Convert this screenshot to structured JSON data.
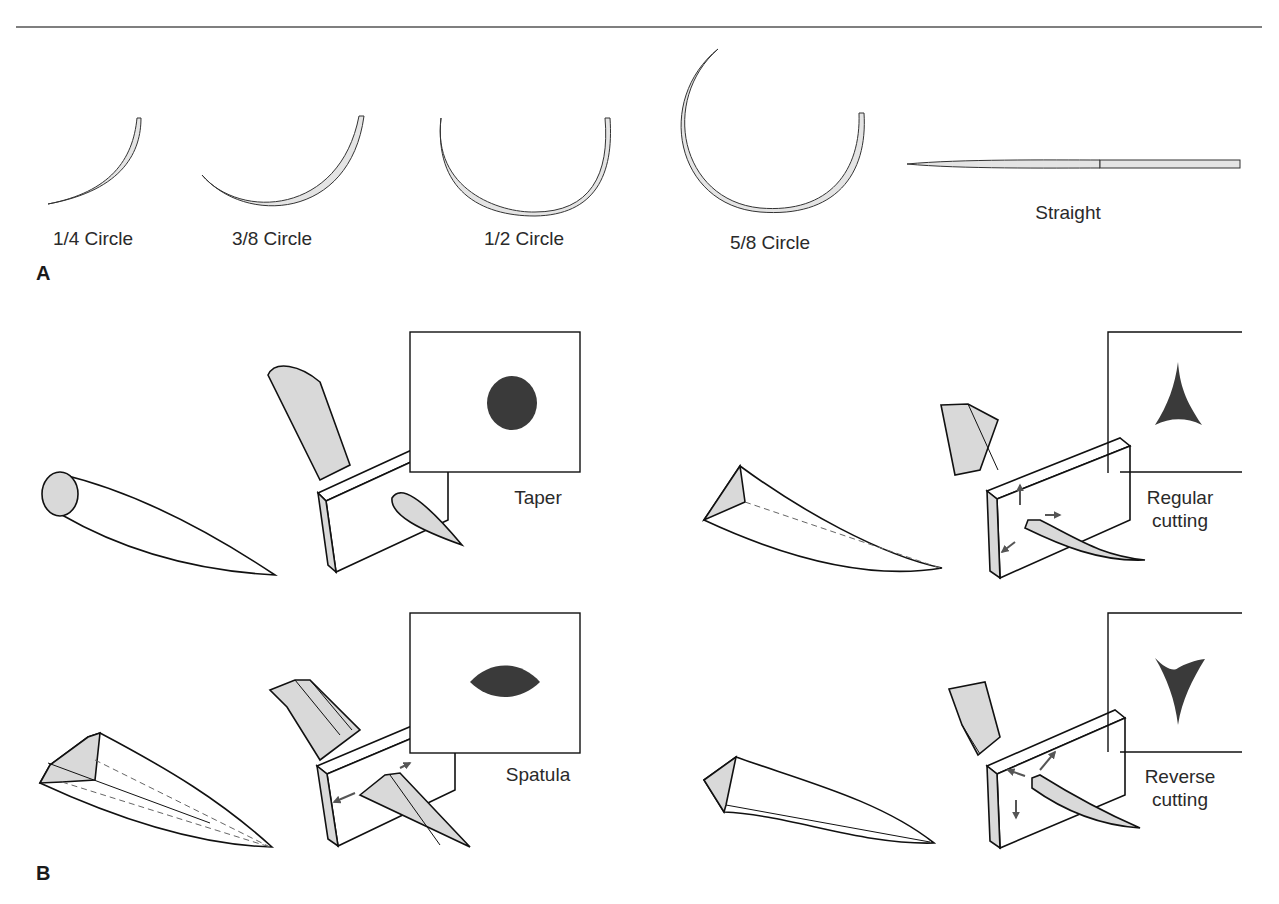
{
  "figure": {
    "panel_a": {
      "label": "A",
      "needles": [
        {
          "shape": "1/4 Circle"
        },
        {
          "shape": "3/8 Circle"
        },
        {
          "shape": "1/2 Circle"
        },
        {
          "shape": "5/8 Circle"
        },
        {
          "shape": "Straight"
        }
      ]
    },
    "panel_b": {
      "label": "B",
      "tips": [
        {
          "name": "Taper",
          "line1": "Taper",
          "line2": "",
          "cross_section": "circle"
        },
        {
          "name": "Regular cutting",
          "line1": "Regular",
          "line2": "cutting",
          "cross_section": "triangle-apex-up"
        },
        {
          "name": "Spatula",
          "line1": "Spatula",
          "line2": "",
          "cross_section": "lens"
        },
        {
          "name": "Reverse cutting",
          "line1": "Reverse",
          "line2": "cutting",
          "cross_section": "triangle-apex-down"
        }
      ]
    },
    "colors": {
      "line": "#1a1a1a",
      "fill_light": "#d9d9d9",
      "fill_dark": "#3a3a3a",
      "arrow": "#555555"
    }
  }
}
